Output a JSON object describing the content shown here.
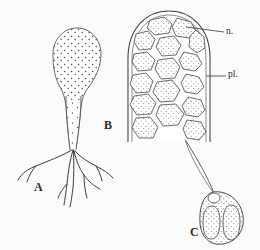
{
  "figure": {
    "background_color": "#fbfbf9",
    "ink_color": "#3a3a3a",
    "stipple_color": "#6a6f7d",
    "width": 260,
    "height": 250,
    "panels": [
      {
        "id": "A",
        "label": "A",
        "name": "stalked-sporangium-with-rhizoids",
        "description": "Pear-shaped stippled sporangium on a tapering stalk with branching rhizoids"
      },
      {
        "id": "B",
        "label": "B",
        "name": "dome-sporangium-section",
        "description": "Dome-shaped sporangium in section filled with polygonal stippled cells"
      },
      {
        "id": "C",
        "label": "C",
        "name": "zoospore",
        "description": "Ovoid zoospore with long flagellum, apical vesicle and two elongate bodies"
      }
    ],
    "annotations": [
      {
        "id": "n",
        "label": "n.",
        "name": "nucleus-annotation",
        "target": "cell nucleus inside sporangium"
      },
      {
        "id": "pl",
        "label": "pl.",
        "name": "plastid-annotation",
        "target": "plastid at sporangium wall"
      }
    ]
  }
}
